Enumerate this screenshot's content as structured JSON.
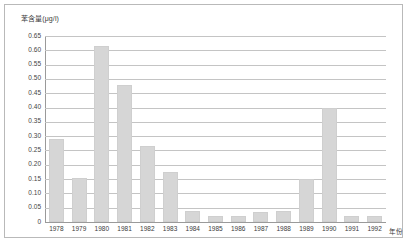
{
  "chart_data": {
    "type": "bar",
    "title": "",
    "ylabel": "苯含量(μg/l)",
    "xlabel": "年份",
    "grid": true,
    "legend": "none",
    "ylim": [
      0,
      0.65
    ],
    "ytick_labels": [
      "0.65",
      "0.60",
      "0.55",
      "0.50",
      "0.45",
      "0.40",
      "0.35",
      "0.30",
      "0.25",
      "0.20",
      "0.15",
      "0.10",
      "0.05",
      "0"
    ],
    "ytick_values": [
      0.65,
      0.6,
      0.55,
      0.5,
      0.45,
      0.4,
      0.35,
      0.3,
      0.25,
      0.2,
      0.15,
      0.1,
      0.05,
      0
    ],
    "categories": [
      "1978",
      "1979",
      "1980",
      "1981",
      "1982",
      "1983",
      "1984",
      "1985",
      "1986",
      "1987",
      "1988",
      "1989",
      "1990",
      "1991",
      "1992"
    ],
    "values": [
      0.29,
      0.155,
      0.615,
      0.48,
      0.265,
      0.175,
      0.04,
      0.02,
      0.02,
      0.035,
      0.04,
      0.15,
      0.4,
      0.02,
      0.02
    ],
    "bar_color": "#d6d6d6",
    "grid_color": "#c4c4c4",
    "axis_color": "#9a9a9a",
    "frame_color": "#b9b9b9",
    "text_color": "#3b3b3b"
  }
}
